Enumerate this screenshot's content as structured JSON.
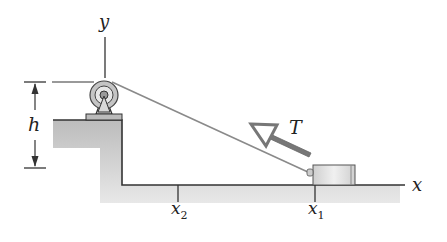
{
  "diagram": {
    "labels": {
      "y_axis": "y",
      "x_axis": "x",
      "height": "h",
      "tension": "T",
      "x1_main": "x",
      "x1_sub": "1",
      "x2_main": "x",
      "x2_sub": "2"
    },
    "colors": {
      "ground_fill": "#c8c8c8",
      "line": "#333333",
      "arrow": "#7a7a7a",
      "block_fill": "#e2e2e2",
      "pulley_fill": "#bdbdbd"
    }
  }
}
